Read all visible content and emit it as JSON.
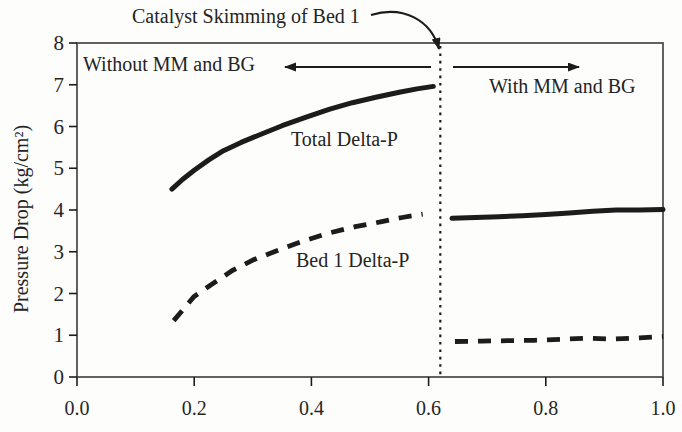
{
  "figure": {
    "background": "#fdfdfc",
    "ink_color": "#1c1c1c",
    "frame_color": "#474747",
    "text_color": "#262626"
  },
  "chart_data": {
    "type": "line",
    "title": "",
    "xlabel": "",
    "ylabel": "Pressure Drop (kg/cm²)",
    "xlim": [
      0.0,
      1.0
    ],
    "ylim": [
      0,
      8
    ],
    "grid": false,
    "frame": true,
    "legend_position": "none",
    "xticks": [
      0.0,
      0.2,
      0.4,
      0.6,
      0.8,
      1.0
    ],
    "x_tick_labels": [
      "0.0",
      "0.2",
      "0.4",
      "0.6",
      "0.8",
      "1.0"
    ],
    "yticks": [
      0,
      1,
      2,
      3,
      4,
      5,
      6,
      7,
      8
    ],
    "y_tick_labels": [
      "0",
      "1",
      "2",
      "3",
      "4",
      "5",
      "6",
      "7",
      "8"
    ],
    "event_line": {
      "x": 0.62,
      "style": "dotted",
      "label": "Catalyst Skimming of Bed 1"
    },
    "region_labels": {
      "left": "Without MM and BG",
      "right": "With MM and BG"
    },
    "series": [
      {
        "name": "Total Delta-P",
        "phase": "without MM and BG",
        "style": "solid",
        "x": [
          0.162,
          0.18,
          0.2,
          0.225,
          0.25,
          0.28,
          0.315,
          0.35,
          0.39,
          0.43,
          0.47,
          0.51,
          0.55,
          0.58,
          0.608
        ],
        "y": [
          4.5,
          4.73,
          4.95,
          5.2,
          5.42,
          5.62,
          5.82,
          6.02,
          6.22,
          6.41,
          6.57,
          6.7,
          6.82,
          6.9,
          6.96
        ]
      },
      {
        "name": "Total Delta-P",
        "phase": "with MM and BG",
        "style": "solid",
        "x": [
          0.64,
          0.68,
          0.72,
          0.76,
          0.8,
          0.84,
          0.88,
          0.92,
          0.96,
          1.0
        ],
        "y": [
          3.8,
          3.82,
          3.84,
          3.86,
          3.89,
          3.93,
          3.97,
          4.0,
          4.0,
          4.01
        ]
      },
      {
        "name": "Bed 1 Delta-P",
        "phase": "without MM and BG",
        "style": "dashed",
        "x": [
          0.165,
          0.2,
          0.23,
          0.265,
          0.3,
          0.34,
          0.385,
          0.43,
          0.475,
          0.52,
          0.555,
          0.59
        ],
        "y": [
          1.35,
          1.93,
          2.22,
          2.55,
          2.8,
          3.02,
          3.25,
          3.45,
          3.6,
          3.72,
          3.82,
          3.9
        ]
      },
      {
        "name": "Bed 1 Delta-P",
        "phase": "with MM and BG",
        "style": "dashed",
        "x": [
          0.645,
          0.69,
          0.735,
          0.78,
          0.825,
          0.87,
          0.915,
          0.96,
          1.0
        ],
        "y": [
          0.85,
          0.86,
          0.87,
          0.88,
          0.9,
          0.93,
          0.91,
          0.94,
          0.97
        ]
      }
    ]
  }
}
